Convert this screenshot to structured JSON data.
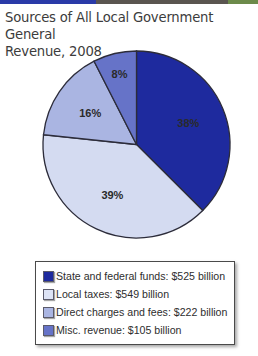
{
  "header": {
    "topbar_colors": [
      "#2a3aa8",
      "#5a5550",
      "#6c8a4a"
    ]
  },
  "chart_data": {
    "type": "pie",
    "title": "Sources of All Local Government General Revenue, 2008",
    "start_angle_deg": 0,
    "direction": "clockwise",
    "slices": [
      {
        "label": "State and federal funds",
        "value_billion": 525,
        "percent": 38,
        "percent_label": "38%",
        "color": "#1e2a9e"
      },
      {
        "label": "Local taxes",
        "value_billion": 549,
        "percent": 39,
        "percent_label": "39%",
        "color": "#d4dbf1"
      },
      {
        "label": "Direct charges and fees",
        "value_billion": 222,
        "percent": 16,
        "percent_label": "16%",
        "color": "#aab5e2"
      },
      {
        "label": "Misc. revenue",
        "value_billion": 105,
        "percent": 8,
        "percent_label": "8%",
        "color": "#6673c8"
      }
    ],
    "total_billion": 1401,
    "legend_position": "bottom"
  },
  "title": {
    "line1": "Sources of All Local Government General",
    "line2": "Revenue, 2008"
  },
  "legend": {
    "items": [
      {
        "text": "State and federal funds: $525 billion",
        "color": "#1e2a9e"
      },
      {
        "text": "Local taxes: $549 billion",
        "color": "#dde3f5"
      },
      {
        "text": "Direct charges and fees: $222 billion",
        "color": "#aab5e2"
      },
      {
        "text": "Misc. revenue: $105 billion",
        "color": "#6673c8"
      }
    ]
  }
}
